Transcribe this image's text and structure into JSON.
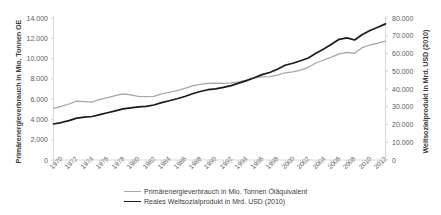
{
  "chart_data": {
    "type": "line",
    "title": "",
    "xlabel": "",
    "grid": false,
    "legend_position": "bottom",
    "x": [
      1970,
      1971,
      1972,
      1973,
      1974,
      1975,
      1976,
      1977,
      1978,
      1979,
      1980,
      1981,
      1982,
      1983,
      1984,
      1985,
      1986,
      1987,
      1988,
      1989,
      1990,
      1991,
      1992,
      1993,
      1994,
      1995,
      1996,
      1997,
      1998,
      1999,
      2000,
      2001,
      2002,
      2003,
      2004,
      2005,
      2006,
      2007,
      2008,
      2009,
      2010,
      2011,
      2012,
      2013
    ],
    "xtick_labels": [
      "1970",
      "1972",
      "1974",
      "1976",
      "1978",
      "1980",
      "1982",
      "1984",
      "1986",
      "1988",
      "1990",
      "1992",
      "1994",
      "1996",
      "1998",
      "2000",
      "2002",
      "2004",
      "2006",
      "2008",
      "2010",
      "2012"
    ],
    "xlim": [
      1970,
      2013
    ],
    "axes": [
      {
        "id": "left",
        "label": "Primärenergieverbrauch in Mio. Tonnen OE",
        "ticks": [
          "0",
          "2.000",
          "4.000",
          "6.000",
          "8.000",
          "10.000",
          "12.000",
          "14.000"
        ],
        "tick_values": [
          0,
          2000,
          4000,
          6000,
          8000,
          10000,
          12000,
          14000
        ],
        "ylim": [
          0,
          14000
        ]
      },
      {
        "id": "right",
        "label": "Weltsozialprodukt in Mrd. USD (2010)",
        "ticks": [
          "0",
          "10.000",
          "20.000",
          "30.000",
          "40.000",
          "50.000",
          "60.000",
          "70.000",
          "80.000"
        ],
        "tick_values": [
          0,
          10000,
          20000,
          30000,
          40000,
          50000,
          60000,
          70000,
          80000
        ],
        "ylim": [
          0,
          80000
        ]
      }
    ],
    "series": [
      {
        "name": "Primärenergieverbrauch in Mio. Tonnen Öläquivalent",
        "axis": "left",
        "color": "#a6a6a6",
        "unit": "Mio. Tonnen Öläquivalent",
        "values": [
          5080,
          5280,
          5520,
          5800,
          5760,
          5700,
          5980,
          6160,
          6340,
          6520,
          6420,
          6280,
          6240,
          6280,
          6520,
          6680,
          6840,
          7060,
          7300,
          7450,
          7560,
          7580,
          7560,
          7600,
          7700,
          7870,
          8100,
          8200,
          8230,
          8360,
          8600,
          8690,
          8860,
          9140,
          9560,
          9860,
          10140,
          10460,
          10620,
          10520,
          11080,
          11340,
          11530,
          11720
        ]
      },
      {
        "name": "Reales Weltsozialprodukt in Mrd. USD (2010)",
        "axis": "right",
        "color": "#1a1a1a",
        "unit": "Mrd. USD (2010)",
        "values": [
          20300,
          21100,
          22200,
          23600,
          24200,
          24500,
          25600,
          26600,
          27700,
          28800,
          29400,
          29900,
          30200,
          31000,
          32300,
          33400,
          34500,
          35800,
          37300,
          38600,
          39600,
          40100,
          40900,
          41900,
          43300,
          44700,
          46300,
          48100,
          49300,
          51100,
          53400,
          54500,
          55900,
          57500,
          60100,
          62500,
          65200,
          68000,
          68800,
          67600,
          70700,
          73000,
          74800,
          76700
        ]
      }
    ]
  },
  "legend": {
    "items": [
      {
        "label": "Primärenergieverbrauch in Mio. Tonnen Öläquivalent"
      },
      {
        "label": "Reales Weltsozialprodukt in Mrd. USD (2010)"
      }
    ]
  }
}
